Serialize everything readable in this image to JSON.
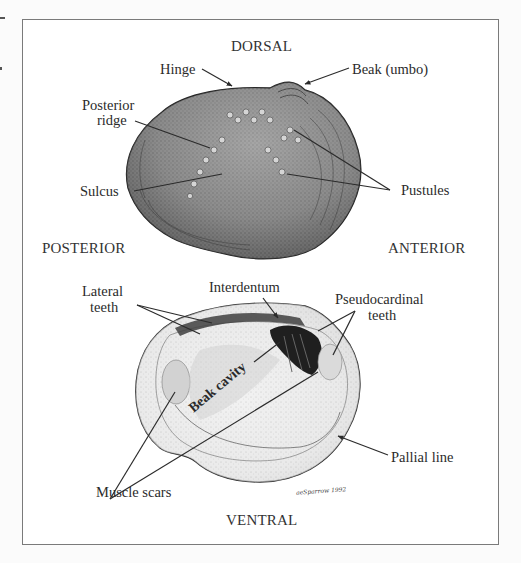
{
  "figure": {
    "type": "labeled anatomical illustration",
    "orientation_labels": {
      "top": "DORSAL",
      "bottom": "VENTRAL",
      "left": "POSTERIOR",
      "right": "ANTERIOR"
    },
    "exterior_view": {
      "labels": [
        {
          "id": "hinge",
          "text": "Hinge"
        },
        {
          "id": "beak",
          "text": "Beak (umbo)"
        },
        {
          "id": "posterior_ridge_1",
          "text": "Posterior"
        },
        {
          "id": "posterior_ridge_2",
          "text": "ridge"
        },
        {
          "id": "sulcus",
          "text": "Sulcus"
        },
        {
          "id": "pustules",
          "text": "Pustules"
        }
      ]
    },
    "interior_view": {
      "labels": [
        {
          "id": "lateral_teeth_1",
          "text": "Lateral"
        },
        {
          "id": "lateral_teeth_2",
          "text": "teeth"
        },
        {
          "id": "interdentum",
          "text": "Interdentum"
        },
        {
          "id": "pseudocardinal_1",
          "text": "Pseudocardinal"
        },
        {
          "id": "pseudocardinal_2",
          "text": "teeth"
        },
        {
          "id": "beak_cavity",
          "text": "Beak cavity"
        },
        {
          "id": "pallial_line",
          "text": "Pallial line"
        },
        {
          "id": "muscle_scars",
          "text": "Muscle scars"
        }
      ]
    },
    "signature": "aeSparrow 1992",
    "colors": {
      "background": "#fbfbfb",
      "frame": "#7a7a7a",
      "ink": "#2b2b2b",
      "shell_dark": "#5a5a5a",
      "shell_light": "#d9d9d9"
    }
  }
}
